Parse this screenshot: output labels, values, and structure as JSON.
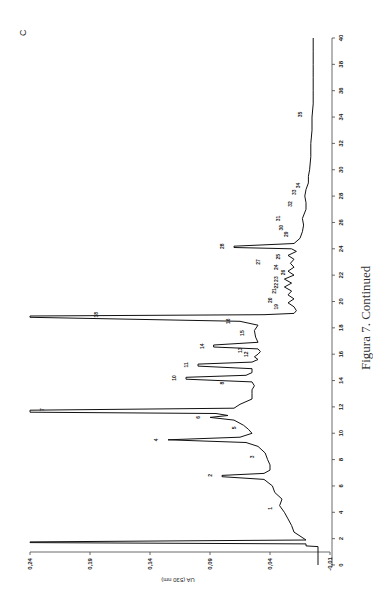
{
  "panel_letter": "C",
  "caption": "Figura 7. Continued",
  "chart_data": {
    "type": "line",
    "title": "",
    "orientation": "rotated 90° counter-clockwise (time axis vertical on right, absorbance axis horizontal at bottom)",
    "xlabel": "Time (min)",
    "ylabel": "UA (530 nm)",
    "xlim": [
      0,
      40
    ],
    "ylim": [
      -0.01,
      0.24
    ],
    "x_ticks": [
      "0",
      "2",
      "4",
      "6",
      "8",
      "10",
      "12",
      "14",
      "16",
      "18",
      "20",
      "22",
      "24",
      "26",
      "28",
      "30",
      "32",
      "34",
      "36",
      "38",
      "40"
    ],
    "y_ticks": [
      "0,24",
      "0,19",
      "0,14",
      "0,09",
      "0,04",
      "-0,01"
    ],
    "grid": false,
    "legend": null,
    "series": [
      {
        "name": "Chromatogram",
        "x": [
          0,
          1.4,
          1.45,
          1.6,
          1.7,
          1.75,
          1.9,
          2.2,
          2.5,
          3.0,
          3.5,
          4.0,
          4.5,
          5.0,
          5.5,
          6.0,
          6.5,
          6.7,
          6.8,
          6.95,
          7.2,
          7.6,
          8.0,
          8.5,
          9.0,
          9.3,
          9.5,
          9.7,
          10.0,
          10.3,
          10.6,
          11.0,
          11.2,
          11.35,
          11.5,
          11.6,
          11.75,
          11.9,
          12.2,
          12.6,
          13.0,
          13.3,
          13.6,
          13.9,
          14.1,
          14.25,
          14.4,
          14.6,
          14.9,
          15.1,
          15.25,
          15.4,
          15.6,
          15.8,
          16.0,
          16.2,
          16.4,
          16.55,
          16.7,
          16.9,
          17.3,
          17.8,
          18.2,
          18.5,
          18.8,
          18.9,
          19.0,
          19.1,
          19.3,
          19.6,
          19.9,
          20.2,
          20.5,
          20.8,
          21.1,
          21.4,
          21.7,
          22.0,
          22.3,
          22.6,
          22.9,
          23.2,
          23.5,
          23.8,
          24.0,
          24.1,
          24.2,
          24.4,
          24.8,
          25.3,
          25.8,
          26.3,
          27.0,
          27.5,
          28.0,
          28.5,
          29.0,
          29.5,
          30.0,
          31.0,
          32.0,
          33.0,
          34.0,
          35.0,
          36.0,
          37.0,
          38.0,
          39.0,
          40.0
        ],
        "values": [
          0.0,
          0.0,
          0.01,
          0.01,
          0.24,
          0.24,
          0.01,
          0.015,
          0.02,
          0.022,
          0.025,
          0.028,
          0.032,
          0.03,
          0.036,
          0.038,
          0.045,
          0.08,
          0.08,
          0.045,
          0.04,
          0.04,
          0.042,
          0.044,
          0.05,
          0.06,
          0.125,
          0.065,
          0.055,
          0.058,
          0.062,
          0.07,
          0.09,
          0.075,
          0.085,
          0.24,
          0.24,
          0.07,
          0.065,
          0.055,
          0.055,
          0.055,
          0.053,
          0.055,
          0.11,
          0.11,
          0.06,
          0.055,
          0.055,
          0.1,
          0.1,
          0.055,
          0.05,
          0.053,
          0.05,
          0.048,
          0.05,
          0.087,
          0.087,
          0.05,
          0.052,
          0.053,
          0.05,
          0.065,
          0.24,
          0.24,
          0.045,
          0.02,
          0.018,
          0.02,
          0.025,
          0.02,
          0.025,
          0.022,
          0.028,
          0.022,
          0.028,
          0.02,
          0.025,
          0.02,
          0.023,
          0.02,
          0.025,
          0.018,
          0.022,
          0.07,
          0.07,
          0.02,
          0.015,
          0.013,
          0.012,
          0.013,
          0.01,
          0.01,
          0.011,
          0.01,
          0.008,
          0.008,
          0.007,
          0.006,
          0.006,
          0.005,
          0.005,
          0.004,
          0.004,
          0.004,
          0.004,
          0.004,
          0.004
        ]
      }
    ],
    "annotations": [
      {
        "label": "1",
        "x": 4.3,
        "y": 0.035
      },
      {
        "label": "2",
        "x": 6.8,
        "y": 0.085
      },
      {
        "label": "3",
        "x": 8.2,
        "y": 0.05
      },
      {
        "label": "4",
        "x": 9.5,
        "y": 0.13
      },
      {
        "label": "5",
        "x": 10.4,
        "y": 0.065
      },
      {
        "label": "6",
        "x": 11.2,
        "y": 0.095
      },
      {
        "label": "7",
        "x": 11.8,
        "y": 0.225
      },
      {
        "label": "8",
        "x": 13.8,
        "y": 0.075
      },
      {
        "label": "10",
        "x": 14.2,
        "y": 0.115
      },
      {
        "label": "11",
        "x": 15.2,
        "y": 0.105
      },
      {
        "label": "12",
        "x": 16.0,
        "y": 0.055
      },
      {
        "label": "13",
        "x": 16.3,
        "y": 0.06
      },
      {
        "label": "14",
        "x": 16.6,
        "y": 0.092
      },
      {
        "label": "15",
        "x": 17.6,
        "y": 0.058
      },
      {
        "label": "16",
        "x": 18.5,
        "y": 0.07
      },
      {
        "label": "18",
        "x": 19.0,
        "y": 0.18
      },
      {
        "label": "19",
        "x": 19.6,
        "y": 0.03
      },
      {
        "label": "20",
        "x": 20.1,
        "y": 0.035
      },
      {
        "label": "21",
        "x": 20.8,
        "y": 0.032
      },
      {
        "label": "22",
        "x": 21.2,
        "y": 0.03
      },
      {
        "label": "23",
        "x": 21.7,
        "y": 0.03
      },
      {
        "label": "24",
        "x": 22.6,
        "y": 0.03
      },
      {
        "label": "25",
        "x": 23.4,
        "y": 0.028
      },
      {
        "label": "26",
        "x": 22.2,
        "y": 0.024
      },
      {
        "label": "27",
        "x": 23.0,
        "y": 0.045
      },
      {
        "label": "28",
        "x": 24.2,
        "y": 0.075
      },
      {
        "label": "29",
        "x": 25.1,
        "y": 0.022
      },
      {
        "label": "30",
        "x": 25.6,
        "y": 0.026
      },
      {
        "label": "31",
        "x": 26.3,
        "y": 0.028
      },
      {
        "label": "32",
        "x": 27.4,
        "y": 0.018
      },
      {
        "label": "33",
        "x": 28.3,
        "y": 0.015
      },
      {
        "label": "34",
        "x": 28.8,
        "y": 0.012
      },
      {
        "label": "35",
        "x": 34.2,
        "y": 0.01
      }
    ]
  }
}
